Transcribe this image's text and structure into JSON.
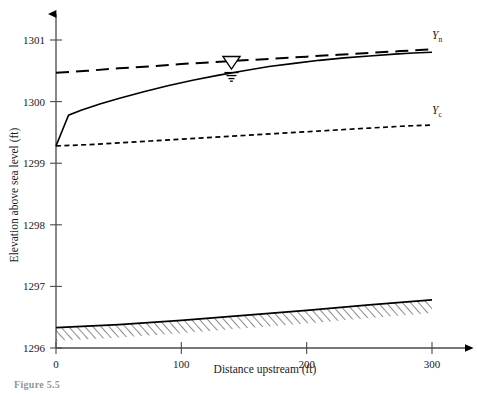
{
  "figure": {
    "caption": "Figure 5.5"
  },
  "chart_data": {
    "type": "line",
    "title": "",
    "xlabel": "Distance upstream (ft)",
    "ylabel": "Elevation above sea level (ft)",
    "xlim": [
      0,
      310
    ],
    "ylim": [
      1296,
      1301.3
    ],
    "xticks": [
      0,
      100,
      200,
      300
    ],
    "xtick_labels": [
      "0",
      "100",
      "200",
      "300"
    ],
    "yticks": [
      1296,
      1297,
      1298,
      1299,
      1300,
      1301
    ],
    "ytick_labels": [
      "1296",
      "1297",
      "1298",
      "1299",
      "1300",
      "1301"
    ],
    "grid": false,
    "legend": "inline-end-labels",
    "annotations": [
      {
        "name": "water-surface-symbol",
        "glyph": "inverted-triangle-with-hatch",
        "x": 140,
        "y": 1300.52
      }
    ],
    "series": [
      {
        "name": "Yn",
        "label": "Y",
        "label_sub": "n",
        "description": "Normal depth line",
        "style": "long-dashed",
        "color": "#000000",
        "label_x": 300,
        "label_y": 1301.02,
        "x": [
          0,
          25,
          50,
          75,
          100,
          125,
          150,
          175,
          200,
          225,
          250,
          275,
          300
        ],
        "y": [
          1300.47,
          1300.5,
          1300.54,
          1300.57,
          1300.61,
          1300.64,
          1300.67,
          1300.7,
          1300.73,
          1300.76,
          1300.79,
          1300.82,
          1300.85
        ]
      },
      {
        "name": "water_surface",
        "label": "",
        "description": "Actual water surface profile (M2 backwater curve)",
        "style": "solid",
        "color": "#000000",
        "x": [
          0,
          10,
          20,
          35,
          50,
          70,
          90,
          110,
          130,
          150,
          170,
          190,
          210,
          230,
          250,
          270,
          285,
          300
        ],
        "y": [
          1299.28,
          1299.78,
          1299.86,
          1299.96,
          1300.05,
          1300.16,
          1300.26,
          1300.35,
          1300.43,
          1300.5,
          1300.57,
          1300.62,
          1300.67,
          1300.71,
          1300.74,
          1300.77,
          1300.79,
          1300.8
        ]
      },
      {
        "name": "Yc",
        "label": "Y",
        "label_sub": "c",
        "description": "Critical depth line",
        "style": "short-dashed",
        "color": "#000000",
        "label_x": 300,
        "label_y": 1299.8,
        "x": [
          0,
          25,
          50,
          75,
          100,
          125,
          150,
          175,
          200,
          225,
          250,
          275,
          300
        ],
        "y": [
          1299.28,
          1299.3,
          1299.33,
          1299.36,
          1299.39,
          1299.42,
          1299.45,
          1299.48,
          1299.51,
          1299.54,
          1299.57,
          1299.6,
          1299.62
        ]
      },
      {
        "name": "channel_bed",
        "label": "",
        "description": "Channel bed with hatching below",
        "style": "solid-hatched",
        "color": "#000000",
        "x": [
          0,
          50,
          100,
          150,
          200,
          250,
          300
        ],
        "y": [
          1296.33,
          1296.38,
          1296.45,
          1296.53,
          1296.61,
          1296.7,
          1296.78
        ]
      }
    ]
  }
}
